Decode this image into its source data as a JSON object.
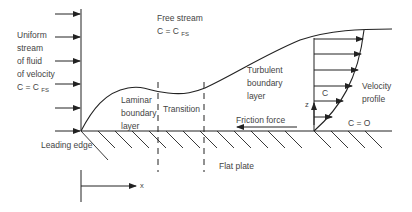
{
  "figure": {
    "labels": {
      "uniform_stream": [
        "Uniform",
        "stream",
        "of fluid",
        "of velocity"
      ],
      "uniform_stream_eq": "C = C",
      "uniform_stream_eq_sub": "FS",
      "free_stream": "Free stream",
      "free_stream_eq": "C = C",
      "free_stream_eq_sub": "FS",
      "laminar": [
        "Laminar",
        "boundary",
        "layer"
      ],
      "transition": "Transition",
      "turbulent": [
        "Turbulent",
        "boundary",
        "layer"
      ],
      "velocity_profile": [
        "Velocity",
        "profile"
      ],
      "c_label": "C",
      "z_label": "z",
      "wall_velocity": "C = O",
      "friction_force": "Friction force",
      "leading_edge": "Leading edge",
      "flat_plate": "Flat plate",
      "x_axis": "x"
    },
    "colors": {
      "line": "#222222",
      "text": "#444444",
      "background": "#ffffff"
    }
  }
}
